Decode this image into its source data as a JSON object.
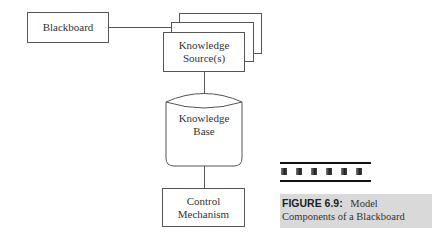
{
  "diagram": {
    "nodes": {
      "blackboard": "Blackboard",
      "knowledge_source_line1": "Knowledge",
      "knowledge_source_line2": "Source(s)",
      "knowledge_base_line1": "Knowledge",
      "knowledge_base_line2": "Base",
      "control_line1": "Control",
      "control_line2": "Mechanism"
    },
    "edges": [
      {
        "from": "Blackboard",
        "to": "Knowledge Source(s)"
      },
      {
        "from": "Knowledge Source(s)",
        "to": "Knowledge Base"
      },
      {
        "from": "Knowledge Base",
        "to": "Control Mechanism"
      }
    ]
  },
  "caption": {
    "label": "FIGURE 6.9:",
    "text_line1": "Model",
    "text_line2": "Components of a Blackboard"
  },
  "colors": {
    "line": "#555555",
    "caption_bg": "#d9d9d9"
  }
}
